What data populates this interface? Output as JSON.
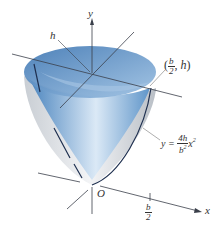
{
  "diagram": {
    "type": "3d-surface",
    "colors": {
      "surface": "#6a9ccc",
      "surface_light": "#cfe0f0",
      "outer": "#d8dde2",
      "axis": "#3a3f4a",
      "curve": "#1f3050"
    },
    "labels": {
      "y_axis": "y",
      "x_axis": "x",
      "origin": "O",
      "height": "h",
      "point": {
        "open": "(",
        "num": "b",
        "den": "2",
        "sep": ", h",
        "close": ")"
      },
      "equation": {
        "lhs": "y =",
        "num": "4h",
        "den": "b",
        "den_exp": "2",
        "var": "x",
        "exp": "2"
      },
      "tick_x": {
        "num": "b",
        "den": "2"
      }
    }
  }
}
